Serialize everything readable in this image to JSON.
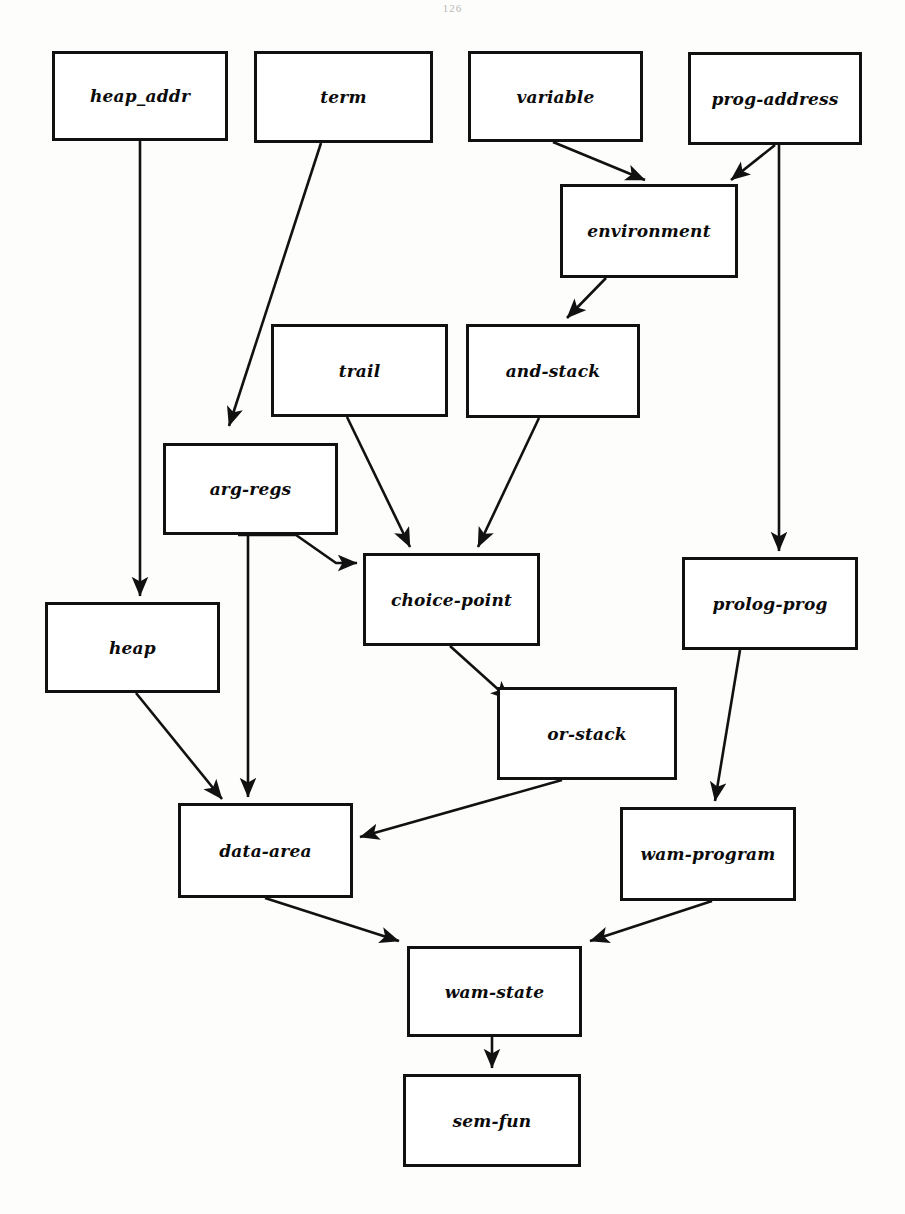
{
  "page": {
    "number": "126",
    "width": 905,
    "height": 1214,
    "background_color": "#fdfdfc",
    "ink_color": "#111111"
  },
  "diagram": {
    "type": "class-hierarchy-diagram",
    "nodes": [
      {
        "id": "heap_addr",
        "label": "heap_addr",
        "x": 52,
        "y": 51,
        "w": 176,
        "h": 90
      },
      {
        "id": "term",
        "label": "term",
        "x": 254,
        "y": 51,
        "w": 179,
        "h": 92
      },
      {
        "id": "variable",
        "label": "variable",
        "x": 468,
        "y": 51,
        "w": 175,
        "h": 91
      },
      {
        "id": "prog-address",
        "label": "prog-address",
        "x": 688,
        "y": 52,
        "w": 174,
        "h": 93
      },
      {
        "id": "environment",
        "label": "environment",
        "x": 560,
        "y": 184,
        "w": 178,
        "h": 94
      },
      {
        "id": "trail",
        "label": "trail",
        "x": 271,
        "y": 324,
        "w": 177,
        "h": 93
      },
      {
        "id": "and-stack",
        "label": "and-stack",
        "x": 466,
        "y": 324,
        "w": 174,
        "h": 94
      },
      {
        "id": "arg-regs",
        "label": "arg-regs",
        "x": 163,
        "y": 443,
        "w": 175,
        "h": 92
      },
      {
        "id": "choice-point",
        "label": "choice-point",
        "x": 363,
        "y": 553,
        "w": 177,
        "h": 93
      },
      {
        "id": "prolog-prog",
        "label": "prolog-prog",
        "x": 682,
        "y": 557,
        "w": 176,
        "h": 93
      },
      {
        "id": "heap",
        "label": "heap",
        "x": 45,
        "y": 602,
        "w": 175,
        "h": 91
      },
      {
        "id": "or-stack",
        "label": "or-stack",
        "x": 497,
        "y": 687,
        "w": 180,
        "h": 93
      },
      {
        "id": "data-area",
        "label": "data-area",
        "x": 178,
        "y": 803,
        "w": 175,
        "h": 95
      },
      {
        "id": "wam-program",
        "label": "wam-program",
        "x": 620,
        "y": 807,
        "w": 176,
        "h": 94
      },
      {
        "id": "wam-state",
        "label": "wam-state",
        "x": 407,
        "y": 946,
        "w": 175,
        "h": 91
      },
      {
        "id": "sem-fun",
        "label": "sem-fun",
        "x": 403,
        "y": 1074,
        "w": 178,
        "h": 93
      }
    ],
    "edges": [
      {
        "id": "heap_addr-to-heap",
        "from": "heap_addr",
        "to": "heap",
        "points": "140,141 140,596",
        "arrow": true
      },
      {
        "id": "term-to-arg-regs",
        "from": "term",
        "to": "arg-regs",
        "points": "321,143 229,426",
        "arrow": true
      },
      {
        "id": "variable-to-environment",
        "from": "variable",
        "to": "environment",
        "points": "553,142 645,180",
        "arrow": true
      },
      {
        "id": "prog-address-to-environment",
        "from": "prog-address",
        "to": "environment",
        "points": "775,145 731,180",
        "arrow": true
      },
      {
        "id": "prog-address-to-prolog-prog",
        "from": "prog-address",
        "to": "prolog-prog",
        "points": "779,145 779,551",
        "arrow": true
      },
      {
        "id": "environment-to-and-stack",
        "from": "environment",
        "to": "and-stack",
        "points": "606,278 567,318",
        "arrow": true
      },
      {
        "id": "trail-to-choice-point",
        "from": "trail",
        "to": "choice-point",
        "points": "347,417 410,547",
        "arrow": true
      },
      {
        "id": "and-stack-to-choice-point",
        "from": "and-stack",
        "to": "choice-point",
        "points": "539,418 478,547",
        "arrow": true
      },
      {
        "id": "arg-regs-to-choice-point",
        "from": "arg-regs",
        "to": "choice-point",
        "points": "238,535 296,535 336,563 357,563",
        "arrow": true
      },
      {
        "id": "arg-regs-to-data-area",
        "from": "arg-regs",
        "to": "data-area",
        "points": "248,535 248,797",
        "arrow": true
      },
      {
        "id": "choice-point-to-or-stack",
        "from": "choice-point",
        "to": "or-stack",
        "points": "450,646 510,700",
        "arrow": true
      },
      {
        "id": "heap-to-data-area",
        "from": "heap",
        "to": "data-area",
        "points": "136,693 222,799",
        "arrow": true
      },
      {
        "id": "or-stack-to-data-area",
        "from": "or-stack",
        "to": "data-area",
        "points": "562,780 360,837",
        "arrow": true
      },
      {
        "id": "prolog-prog-to-wam-program",
        "from": "prolog-prog",
        "to": "wam-program",
        "points": "740,650 715,801",
        "arrow": true
      },
      {
        "id": "data-area-to-wam-state",
        "from": "data-area",
        "to": "wam-state",
        "points": "265,898 399,941",
        "arrow": true
      },
      {
        "id": "wam-program-to-wam-state",
        "from": "wam-program",
        "to": "wam-state",
        "points": "712,901 590,941",
        "arrow": true
      },
      {
        "id": "wam-state-to-sem-fun",
        "from": "wam-state",
        "to": "sem-fun",
        "points": "492,1037 492,1068",
        "arrow": true
      }
    ]
  }
}
